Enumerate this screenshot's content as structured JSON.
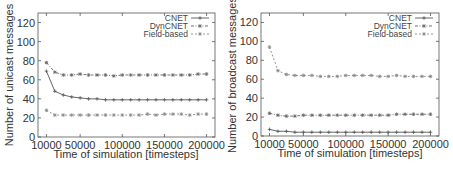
{
  "chart_data": [
    {
      "type": "line",
      "title": "",
      "xlabel": "Time of simulation [timesteps]",
      "ylabel": "Number of unicast messages",
      "xlim": [
        0,
        210000
      ],
      "ylim": [
        0,
        130
      ],
      "xticks": [
        10000,
        50000,
        100000,
        150000,
        200000
      ],
      "yticks": [
        0,
        20,
        40,
        60,
        80,
        100,
        120
      ],
      "grid": false,
      "legend_position": "top-right",
      "x": [
        10000,
        20000,
        30000,
        40000,
        50000,
        60000,
        70000,
        80000,
        90000,
        100000,
        110000,
        120000,
        130000,
        140000,
        150000,
        160000,
        170000,
        180000,
        190000,
        200000
      ],
      "series": [
        {
          "name": "CNET",
          "style": "solid-plus",
          "values": [
            69,
            48,
            44,
            42,
            41,
            40,
            40,
            39,
            39,
            39,
            39,
            39,
            39,
            39,
            39,
            39,
            39,
            39,
            39,
            39
          ]
        },
        {
          "name": "DynCNET",
          "style": "dashdot-star",
          "values": [
            78,
            68,
            65,
            65,
            66,
            65,
            65,
            65,
            64,
            65,
            65,
            65,
            65,
            65,
            65,
            65,
            65,
            65,
            66,
            66
          ]
        },
        {
          "name": "Field-based",
          "style": "dashed-star",
          "values": [
            28,
            23,
            23,
            23,
            23,
            23,
            23,
            23,
            23,
            23,
            23,
            23,
            24,
            23,
            24,
            24,
            24,
            23,
            24,
            24
          ]
        }
      ]
    },
    {
      "type": "line",
      "title": "",
      "xlabel": "Time of simulation [timesteps]",
      "ylabel": "Number of broadcast messages",
      "xlim": [
        0,
        210000
      ],
      "ylim": [
        0,
        130
      ],
      "xticks": [
        10000,
        50000,
        100000,
        150000,
        200000
      ],
      "yticks": [
        0,
        20,
        40,
        60,
        80,
        100,
        120
      ],
      "grid": false,
      "legend_position": "top-right",
      "x": [
        10000,
        20000,
        30000,
        40000,
        50000,
        60000,
        70000,
        80000,
        90000,
        100000,
        110000,
        120000,
        130000,
        140000,
        150000,
        160000,
        170000,
        180000,
        190000,
        200000
      ],
      "series": [
        {
          "name": "CNET",
          "style": "solid-plus",
          "values": [
            7,
            5,
            5,
            4,
            4,
            4,
            4,
            4,
            4,
            4,
            4,
            4,
            4,
            4,
            4,
            4,
            4,
            4,
            4,
            4
          ]
        },
        {
          "name": "DynCNET",
          "style": "dashdot-star",
          "values": [
            24,
            22,
            21,
            21,
            22,
            22,
            22,
            22,
            22,
            22,
            22,
            22,
            22,
            22,
            22,
            23,
            23,
            23,
            23,
            23
          ]
        },
        {
          "name": "Field-based",
          "style": "dashed-star",
          "values": [
            94,
            69,
            65,
            64,
            64,
            64,
            63,
            63,
            63,
            64,
            64,
            64,
            64,
            63,
            63,
            64,
            63,
            63,
            63,
            63
          ]
        }
      ]
    }
  ],
  "left_chart": {
    "ylabel": "Number of unicast messages",
    "xlabel": "Time of simulation [timesteps]",
    "legend": [
      "CNET",
      "DynCNET",
      "Field-based"
    ],
    "xtick_labels": [
      "10000",
      "50000",
      "100000",
      "150000",
      "200000"
    ],
    "ytick_labels": [
      "0",
      "20",
      "40",
      "60",
      "80",
      "100",
      "120"
    ]
  },
  "right_chart": {
    "ylabel": "Number of broadcast messages",
    "xlabel": "Time of simulation [timesteps]",
    "legend": [
      "CNET",
      "DynCNET",
      "Field-based"
    ],
    "xtick_labels": [
      "10000",
      "50000",
      "100000",
      "150000",
      "200000"
    ],
    "ytick_labels": [
      "0",
      "20",
      "40",
      "60",
      "80",
      "100",
      "120"
    ]
  }
}
